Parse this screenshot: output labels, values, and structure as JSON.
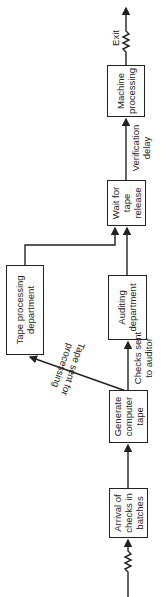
{
  "diagram": {
    "orientation": "rotated-90-ccw",
    "nodes": [
      {
        "id": "arrival",
        "label_lines": [
          "Arrival of",
          "checks in",
          "batches"
        ]
      },
      {
        "id": "generate",
        "label_lines": [
          "Generate",
          "computer",
          "tape"
        ]
      },
      {
        "id": "auditing",
        "label_lines": [
          "Auditing",
          "department"
        ]
      },
      {
        "id": "tape_processing",
        "label_lines": [
          "Tape processing",
          "department"
        ]
      },
      {
        "id": "wait",
        "label_lines": [
          "Wait for",
          "tape",
          "release"
        ]
      },
      {
        "id": "machine",
        "label_lines": [
          "Machine",
          "processing"
        ]
      }
    ],
    "edge_labels": {
      "tape_sent": [
        "Tape sent for",
        "processing"
      ],
      "checks_sent": [
        "Checks sent",
        "to auditor"
      ],
      "verification": [
        "Verification",
        "delay"
      ],
      "exit": "Exit"
    },
    "edges": [
      {
        "from": "input",
        "to": "arrival"
      },
      {
        "from": "arrival",
        "to": "generate"
      },
      {
        "from": "generate",
        "to": "auditing",
        "label": "Checks sent to auditor"
      },
      {
        "from": "generate",
        "to": "tape_processing",
        "label": "Tape sent for processing"
      },
      {
        "from": "auditing",
        "to": "wait"
      },
      {
        "from": "tape_processing",
        "to": "wait"
      },
      {
        "from": "wait",
        "to": "machine",
        "label": "Verification delay"
      },
      {
        "from": "machine",
        "to": "exit",
        "label": "Exit"
      }
    ]
  }
}
